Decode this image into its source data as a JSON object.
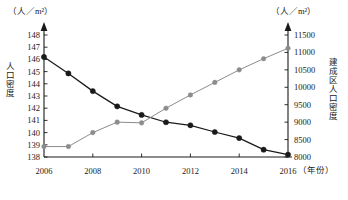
{
  "chart_data": {
    "type": "line",
    "title": "",
    "xlabel": "年份",
    "x": [
      2006,
      2007,
      2008,
      2009,
      2010,
      2011,
      2012,
      2013,
      2014,
      2015,
      2016
    ],
    "xticks": [
      "2006",
      "2008",
      "2010",
      "2012",
      "2014",
      "2016"
    ],
    "xlim": [
      2006,
      2016
    ],
    "grid": false,
    "legend": "none",
    "axes": [
      {
        "id": "left",
        "label": "人口密度",
        "unit": "（人／m²）",
        "ylim": [
          138,
          148
        ],
        "yticks": [
          138,
          139,
          140,
          141,
          142,
          143,
          144,
          145,
          146,
          147,
          148
        ],
        "ytick_labels": [
          "138",
          "139",
          "140",
          "141",
          "142",
          "143",
          "144",
          "145",
          "146",
          "147",
          "148"
        ]
      },
      {
        "id": "right",
        "label": "建成区人口密度",
        "unit": "（人／m²）",
        "ylim": [
          8000,
          11500
        ],
        "yticks": [
          8000,
          8500,
          9000,
          9500,
          10000,
          10500,
          11000,
          11500
        ],
        "ytick_labels": [
          "8000",
          "8500",
          "9000",
          "9500",
          "10000",
          "10500",
          "11000",
          "11500"
        ]
      }
    ],
    "series": [
      {
        "name": "人口密度",
        "axis": "left",
        "color": "#1a1a1a",
        "marker": "filled-circle",
        "values": [
          146.2,
          144.85,
          143.4,
          142.15,
          141.45,
          140.85,
          140.6,
          140.05,
          139.55,
          138.6,
          138.2
        ]
      },
      {
        "name": "建成区人口密度",
        "axis": "right",
        "color": "#8c8c8c",
        "marker": "filled-circle",
        "values": [
          8300,
          8300,
          8700,
          9000,
          8980,
          9400,
          9780,
          10140,
          10500,
          10820,
          11120
        ]
      }
    ]
  },
  "labels": {
    "left_unit": "（人／m²）",
    "right_unit": "（人／m²）",
    "left_axis_title": "人口密度",
    "right_axis_title": "建成区人口密度",
    "x_unit": "（年份）"
  }
}
